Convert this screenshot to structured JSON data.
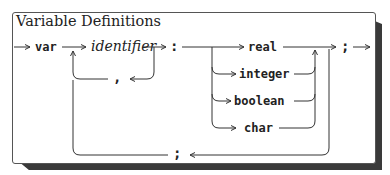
{
  "diagram": {
    "title": "Variable Definitions",
    "type": "syntax-diagram",
    "nodes": {
      "keyword_var": "var",
      "identifier": "identifier",
      "colon": ":",
      "comma": ",",
      "types": [
        "real",
        "integer",
        "boolean",
        "char"
      ],
      "end_semicolon": ";",
      "loop_semicolon": ";"
    },
    "flow": [
      "entry -> var",
      "var -> identifier",
      "identifier -> , -> identifier (loop)",
      "identifier -> :",
      ": -> real | integer | boolean | char",
      "type -> ; (exit)",
      "type -> ; -> identifier (loop back)"
    ]
  }
}
